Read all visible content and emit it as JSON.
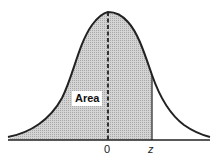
{
  "diagram": {
    "area_label": "Area",
    "x_ticks": [
      {
        "label": "0"
      },
      {
        "label": "z"
      }
    ],
    "colors": {
      "curve": "#222222",
      "shade": "#c8c8c8",
      "background": "#ffffff"
    }
  }
}
